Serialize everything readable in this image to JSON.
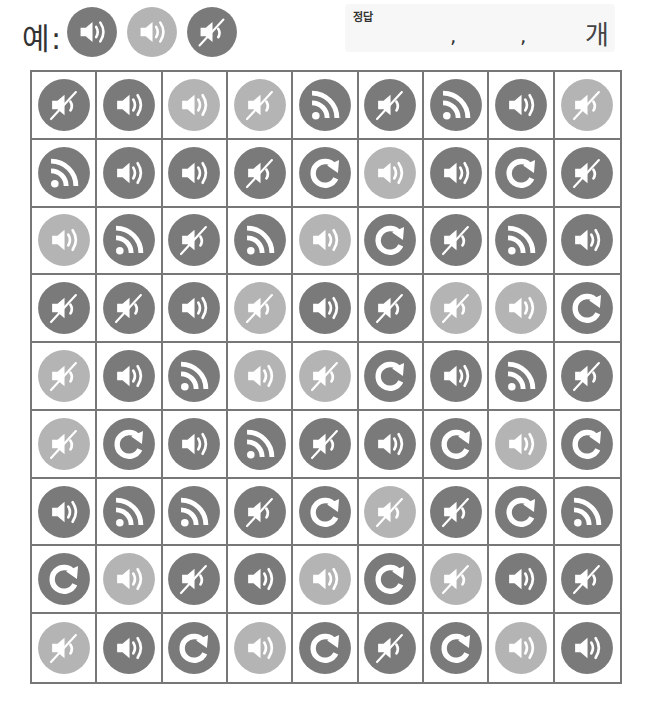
{
  "header": {
    "example_label": "예:",
    "example_icons": [
      {
        "type": "speaker",
        "shade": "dark"
      },
      {
        "type": "speaker",
        "shade": "light"
      },
      {
        "type": "mute",
        "shade": "dark"
      }
    ],
    "answer_title": "정답",
    "answer_separator_1": ",",
    "answer_separator_2": ",",
    "answer_unit": "개"
  },
  "colors": {
    "dark": "#7a7a7a",
    "light": "#b4b4b4",
    "glyph": "#ffffff",
    "grid_line": "#777777"
  },
  "icon_types": {
    "speaker": "speaker-icon",
    "mute": "mute-icon",
    "rss": "rss-icon",
    "refresh": "refresh-icon"
  },
  "grid": {
    "rows": 9,
    "cols": 9,
    "cells": [
      [
        {
          "type": "mute",
          "shade": "dark"
        },
        {
          "type": "speaker",
          "shade": "dark"
        },
        {
          "type": "speaker",
          "shade": "light"
        },
        {
          "type": "mute",
          "shade": "light"
        },
        {
          "type": "rss",
          "shade": "dark"
        },
        {
          "type": "mute",
          "shade": "dark"
        },
        {
          "type": "rss",
          "shade": "dark"
        },
        {
          "type": "speaker",
          "shade": "dark"
        },
        {
          "type": "mute",
          "shade": "light"
        }
      ],
      [
        {
          "type": "rss",
          "shade": "dark"
        },
        {
          "type": "speaker",
          "shade": "dark"
        },
        {
          "type": "speaker",
          "shade": "dark"
        },
        {
          "type": "mute",
          "shade": "dark"
        },
        {
          "type": "refresh",
          "shade": "dark"
        },
        {
          "type": "speaker",
          "shade": "light"
        },
        {
          "type": "speaker",
          "shade": "dark"
        },
        {
          "type": "refresh",
          "shade": "dark"
        },
        {
          "type": "mute",
          "shade": "dark"
        }
      ],
      [
        {
          "type": "speaker",
          "shade": "light"
        },
        {
          "type": "rss",
          "shade": "dark"
        },
        {
          "type": "mute",
          "shade": "dark"
        },
        {
          "type": "rss",
          "shade": "dark"
        },
        {
          "type": "speaker",
          "shade": "light"
        },
        {
          "type": "refresh",
          "shade": "dark"
        },
        {
          "type": "mute",
          "shade": "dark"
        },
        {
          "type": "rss",
          "shade": "dark"
        },
        {
          "type": "speaker",
          "shade": "dark"
        }
      ],
      [
        {
          "type": "mute",
          "shade": "dark"
        },
        {
          "type": "mute",
          "shade": "dark"
        },
        {
          "type": "speaker",
          "shade": "dark"
        },
        {
          "type": "mute",
          "shade": "light"
        },
        {
          "type": "speaker",
          "shade": "dark"
        },
        {
          "type": "mute",
          "shade": "dark"
        },
        {
          "type": "mute",
          "shade": "light"
        },
        {
          "type": "speaker",
          "shade": "light"
        },
        {
          "type": "refresh",
          "shade": "dark"
        }
      ],
      [
        {
          "type": "mute",
          "shade": "light"
        },
        {
          "type": "speaker",
          "shade": "dark"
        },
        {
          "type": "rss",
          "shade": "dark"
        },
        {
          "type": "speaker",
          "shade": "light"
        },
        {
          "type": "mute",
          "shade": "light"
        },
        {
          "type": "refresh",
          "shade": "dark"
        },
        {
          "type": "speaker",
          "shade": "dark"
        },
        {
          "type": "rss",
          "shade": "dark"
        },
        {
          "type": "mute",
          "shade": "dark"
        }
      ],
      [
        {
          "type": "mute",
          "shade": "light"
        },
        {
          "type": "refresh",
          "shade": "dark"
        },
        {
          "type": "speaker",
          "shade": "dark"
        },
        {
          "type": "rss",
          "shade": "dark"
        },
        {
          "type": "mute",
          "shade": "dark"
        },
        {
          "type": "speaker",
          "shade": "dark"
        },
        {
          "type": "refresh",
          "shade": "dark"
        },
        {
          "type": "speaker",
          "shade": "light"
        },
        {
          "type": "refresh",
          "shade": "dark"
        }
      ],
      [
        {
          "type": "speaker",
          "shade": "dark"
        },
        {
          "type": "rss",
          "shade": "dark"
        },
        {
          "type": "rss",
          "shade": "dark"
        },
        {
          "type": "mute",
          "shade": "dark"
        },
        {
          "type": "refresh",
          "shade": "dark"
        },
        {
          "type": "mute",
          "shade": "light"
        },
        {
          "type": "mute",
          "shade": "dark"
        },
        {
          "type": "refresh",
          "shade": "dark"
        },
        {
          "type": "rss",
          "shade": "dark"
        }
      ],
      [
        {
          "type": "refresh",
          "shade": "dark"
        },
        {
          "type": "speaker",
          "shade": "light"
        },
        {
          "type": "mute",
          "shade": "dark"
        },
        {
          "type": "speaker",
          "shade": "dark"
        },
        {
          "type": "speaker",
          "shade": "light"
        },
        {
          "type": "refresh",
          "shade": "dark"
        },
        {
          "type": "mute",
          "shade": "light"
        },
        {
          "type": "speaker",
          "shade": "dark"
        },
        {
          "type": "mute",
          "shade": "dark"
        }
      ],
      [
        {
          "type": "mute",
          "shade": "light"
        },
        {
          "type": "speaker",
          "shade": "dark"
        },
        {
          "type": "refresh",
          "shade": "dark"
        },
        {
          "type": "speaker",
          "shade": "light"
        },
        {
          "type": "refresh",
          "shade": "dark"
        },
        {
          "type": "mute",
          "shade": "dark"
        },
        {
          "type": "refresh",
          "shade": "dark"
        },
        {
          "type": "speaker",
          "shade": "light"
        },
        {
          "type": "speaker",
          "shade": "dark"
        }
      ]
    ]
  }
}
